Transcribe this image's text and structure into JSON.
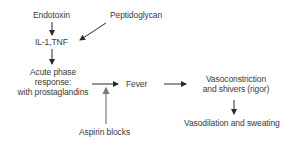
{
  "diagram": {
    "nodes": {
      "endotoxin": "Endotoxin",
      "peptidoglycan": "Peptidoglycan",
      "il1_tnf": "IL-1,TNF",
      "acute_phase_line1": "Acute phase",
      "acute_phase_line2": "response:",
      "acute_phase_line3": "with prostaglandins",
      "fever": "Fever",
      "vasoconstriction_line1": "Vasoconstriction",
      "vasoconstriction_line2": "and shivers (rigor)",
      "vasodilation": "Vasodilation and sweating",
      "aspirin": "Aspirin blocks"
    },
    "edges": [
      {
        "from": "Endotoxin",
        "to": "IL-1,TNF"
      },
      {
        "from": "Peptidoglycan",
        "to": "IL-1,TNF"
      },
      {
        "from": "IL-1,TNF",
        "to": "Acute phase response"
      },
      {
        "from": "Acute phase response",
        "to": "Fever"
      },
      {
        "from": "Fever",
        "to": "Vasoconstriction and shivers (rigor)"
      },
      {
        "from": "Vasoconstriction and shivers (rigor)",
        "to": "Vasodilation and sweating"
      },
      {
        "from": "Aspirin blocks",
        "to": "Acute phase → Fever arrow",
        "style": "grey"
      }
    ],
    "colors": {
      "text": "#3a3a3a",
      "arrow": "#2a2a2a",
      "inhibit_arrow": "#7a7a7a"
    }
  }
}
